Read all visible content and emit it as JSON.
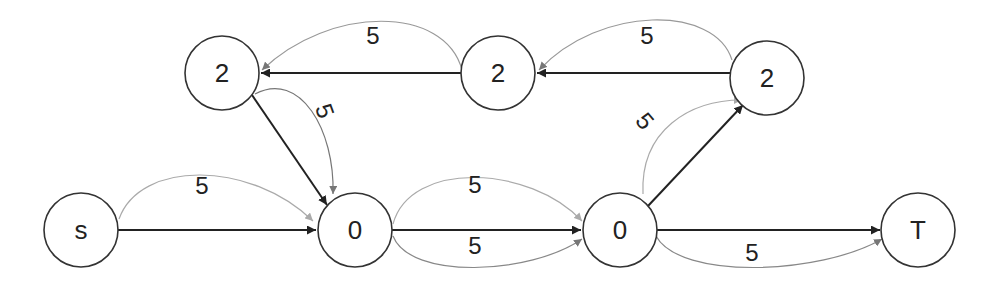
{
  "diagram": {
    "type": "flow-network",
    "nodes": [
      {
        "id": "s",
        "label": "s"
      },
      {
        "id": "a",
        "label": "0"
      },
      {
        "id": "b",
        "label": "0"
      },
      {
        "id": "t",
        "label": "T"
      },
      {
        "id": "c",
        "label": "2"
      },
      {
        "id": "d",
        "label": "2"
      },
      {
        "id": "e",
        "label": "2"
      }
    ],
    "edges": [
      {
        "id": "s-a-straight",
        "from": "s",
        "to": "a",
        "style": "dark",
        "label": ""
      },
      {
        "id": "s-a-curve",
        "from": "s",
        "to": "a",
        "style": "light",
        "label": "5"
      },
      {
        "id": "a-b-straight",
        "from": "a",
        "to": "b",
        "style": "dark",
        "label": "5"
      },
      {
        "id": "a-b-curve-up",
        "from": "a",
        "to": "b",
        "style": "light",
        "label": "5"
      },
      {
        "id": "a-b-curve-down",
        "from": "a",
        "to": "b",
        "style": "medium",
        "label": ""
      },
      {
        "id": "b-t-straight",
        "from": "b",
        "to": "t",
        "style": "dark",
        "label": ""
      },
      {
        "id": "b-t-curve",
        "from": "b",
        "to": "t",
        "style": "medium",
        "label": "5"
      },
      {
        "id": "b-e-straight",
        "from": "b",
        "to": "e",
        "style": "dark",
        "label": ""
      },
      {
        "id": "b-e-curve",
        "from": "b",
        "to": "e",
        "style": "light",
        "label": "5"
      },
      {
        "id": "e-d-straight",
        "from": "e",
        "to": "d",
        "style": "dark",
        "label": ""
      },
      {
        "id": "e-d-curve",
        "from": "e",
        "to": "d",
        "style": "medium",
        "label": "5"
      },
      {
        "id": "d-c-straight",
        "from": "d",
        "to": "c",
        "style": "dark",
        "label": ""
      },
      {
        "id": "d-c-curve",
        "from": "d",
        "to": "c",
        "style": "medium",
        "label": "5"
      },
      {
        "id": "c-a-straight",
        "from": "c",
        "to": "a",
        "style": "dark",
        "label": ""
      },
      {
        "id": "c-a-curve",
        "from": "c",
        "to": "a",
        "style": "medium",
        "label": "5"
      }
    ],
    "colors": {
      "dark": "#222222",
      "medium": "#777777",
      "light": "#aaaaaa",
      "node_stroke": "#333333",
      "background": "#ffffff"
    }
  }
}
